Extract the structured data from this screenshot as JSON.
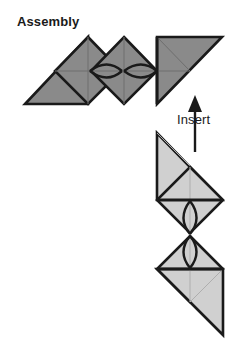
{
  "figure": {
    "title": "Assembly",
    "kind": "origami-modular-assembly-diagram",
    "background_color": "#ffffff",
    "outline_color": "#1a1a1a",
    "labels": [
      {
        "id": "assembly",
        "text": "Assembly",
        "bold": true,
        "x": 17,
        "y": 14
      },
      {
        "id": "insert",
        "text": "Insert",
        "bold": false,
        "x": 177,
        "y": 112
      }
    ],
    "annotations": [
      {
        "id": "insert-arrow",
        "icon": "up-arrow-icon",
        "direction": "up",
        "from_x": 195,
        "from_y": 152,
        "to_x": 195,
        "to_y": 100,
        "color": "#1a1a1a"
      }
    ],
    "assemblies": [
      {
        "id": "upper-chain",
        "fill_color": "#8a8a8a",
        "unit_count": 4,
        "orientation": "horizontal",
        "lens_joints": 2
      },
      {
        "id": "lower-chain",
        "fill_color": "#d0d0d0",
        "unit_count": 4,
        "orientation": "vertical",
        "lens_joints": 2
      }
    ],
    "colors": {
      "dark_gray_fill": "#8a8a8a",
      "light_gray_fill": "#d0d0d0",
      "crease_line": "#6e6e6e",
      "crease_line_light": "#aeaeae",
      "outline": "#1a1a1a",
      "text": "#1a1a1a"
    }
  }
}
